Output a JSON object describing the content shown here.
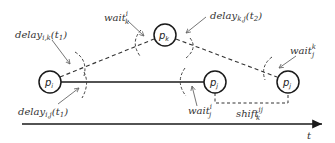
{
  "diagram": {
    "colors": {
      "stroke": "#1a1a1a",
      "dashed": "#333333",
      "arc": "#444444",
      "arrow": "#666666",
      "text": "#333333"
    },
    "nodes": [
      {
        "id": "pi",
        "base": "p",
        "sub": "i",
        "x": 50,
        "y": 82
      },
      {
        "id": "pk",
        "base": "p",
        "sub": "k",
        "x": 165,
        "y": 35
      },
      {
        "id": "pj1",
        "base": "p",
        "sub": "j",
        "x": 215,
        "y": 82
      },
      {
        "id": "pj2",
        "base": "p",
        "sub": "j",
        "x": 288,
        "y": 82
      }
    ],
    "labels": {
      "delay_ik": {
        "base": "delay",
        "sub": "i,k",
        "arg": "(t",
        "argsub": "1",
        "close": ")"
      },
      "delay_ij": {
        "base": "delay",
        "sub": "i,j",
        "arg": "(t",
        "argsub": "1",
        "close": ")"
      },
      "delay_kj": {
        "base": "delay",
        "sub": "k,j",
        "arg": "(t",
        "argsub": "2",
        "close": ")"
      },
      "wait_ki": {
        "base": "wait",
        "sub": "k",
        "sup": "i"
      },
      "wait_ji": {
        "base": "wait",
        "sub": "j",
        "sup": "i"
      },
      "wait_jk": {
        "base": "wait",
        "sub": "j",
        "sup": "k"
      },
      "shift_kij": {
        "base": "shift",
        "sub": "k",
        "sup": "ij"
      }
    },
    "axis": {
      "label": "t"
    }
  }
}
